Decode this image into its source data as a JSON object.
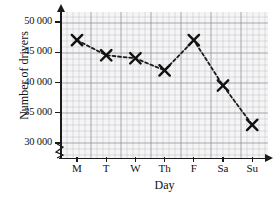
{
  "chart_data": {
    "type": "line",
    "title": "",
    "xlabel": "Day",
    "ylabel": "Number of drivers",
    "categories": [
      "M",
      "T",
      "W",
      "Th",
      "F",
      "Sa",
      "Su"
    ],
    "values": [
      47000,
      44500,
      44000,
      42000,
      47000,
      39500,
      33000
    ],
    "series": [
      {
        "name": "Number of drivers",
        "values": [
          47000,
          44500,
          44000,
          42000,
          47000,
          39500,
          33000
        ]
      }
    ],
    "ylim": [
      30000,
      51000
    ],
    "yticks": [
      30000,
      35000,
      40000,
      45000,
      50000
    ],
    "ytick_labels": [
      "30 000",
      "35 000",
      "40 000",
      "45 000",
      "50 000"
    ],
    "xtick_labels": [
      "M",
      "T",
      "W",
      "Th",
      "F",
      "Sa",
      "Su"
    ],
    "grid": true,
    "grid_minor": true,
    "legend": "none",
    "marker": "x",
    "linestyle": "dashed",
    "axis_break": true,
    "colors": {
      "line": "#1a1a1a",
      "marker": "#111111",
      "grid_major": "#787882",
      "grid_minor": "#96969e",
      "axis": "#1a1a1a",
      "background": "#ffffff"
    }
  }
}
